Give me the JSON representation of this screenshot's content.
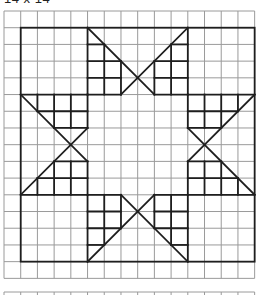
{
  "title": "14 x 14",
  "colors": {
    "grid_line": "#9a9a9a",
    "figure_line": "#1e1e1e",
    "background": "#ffffff"
  },
  "grid": {
    "columns": 15,
    "rows": 16,
    "next_grid_visible": true
  },
  "figure": {
    "square_size": 14,
    "square_origin_cell": [
      1,
      1
    ],
    "arm_top": {
      "diagonals": [
        [
          [
            4,
            0
          ],
          [
            8,
            4
          ]
        ],
        [
          [
            10,
            0
          ],
          [
            6,
            4
          ]
        ]
      ],
      "verticals": [
        [
          4,
          0,
          4
        ],
        [
          5,
          1,
          4
        ],
        [
          6,
          2,
          4
        ],
        [
          8,
          2,
          4
        ],
        [
          9,
          1,
          4
        ],
        [
          10,
          0,
          4
        ]
      ],
      "horizontals": [
        [
          1,
          4,
          5
        ],
        [
          1,
          9,
          10
        ],
        [
          2,
          4,
          6
        ],
        [
          2,
          8,
          10
        ],
        [
          3,
          4,
          6
        ],
        [
          3,
          8,
          10
        ],
        [
          4,
          4,
          6
        ],
        [
          4,
          8,
          10
        ]
      ]
    },
    "arm_rotations_deg": [
      0,
      90,
      180,
      270
    ]
  }
}
